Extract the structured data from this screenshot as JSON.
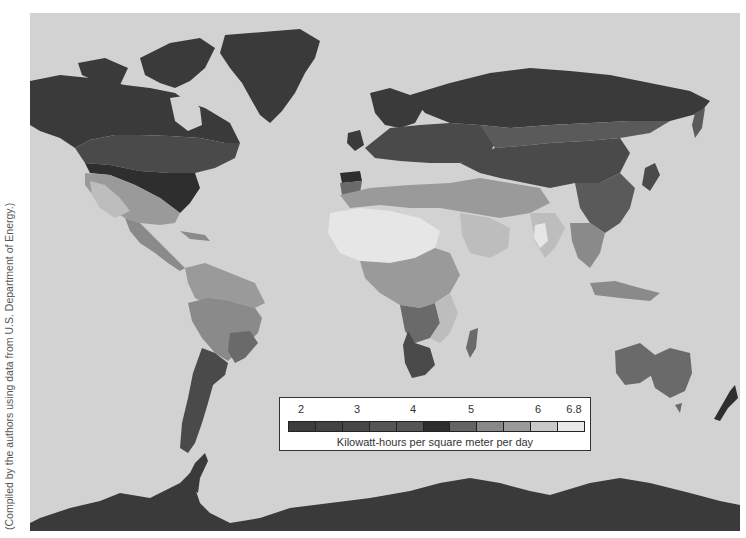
{
  "map": {
    "title": "World solar energy availability",
    "background_color": "#d2d2d2",
    "ocean_color": "#d2d2d2",
    "colors": {
      "band_2": "#3a3a3a",
      "band_2_5": "#444444",
      "band_3": "#4a4a4a",
      "band_3_5": "#555555",
      "band_4": "#5a5a5a",
      "band_4_5": "#2e2e2e",
      "band_5": "#6a6a6a",
      "band_5_5": "#8a8a8a",
      "band_6": "#9a9a9a",
      "band_6_5": "#bdbdbd",
      "band_6_8": "#e6e6e6"
    }
  },
  "legend": {
    "tick_labels": [
      "2",
      "3",
      "4",
      "5",
      "6",
      "6.8"
    ],
    "tick_positions": [
      21,
      77,
      133,
      191,
      258,
      294
    ],
    "swatches": [
      "#3d3d3d",
      "#434343",
      "#474747",
      "#555555",
      "#555555",
      "#2e2e2e",
      "#646464",
      "#888888",
      "#9a9a9a",
      "#c9c9c9",
      "#e8e8e8"
    ],
    "caption": "Kilowatt-hours per square meter per day"
  },
  "credit": {
    "text": "(Compiled by the authors using data from U.S. Department of Energy.)"
  }
}
